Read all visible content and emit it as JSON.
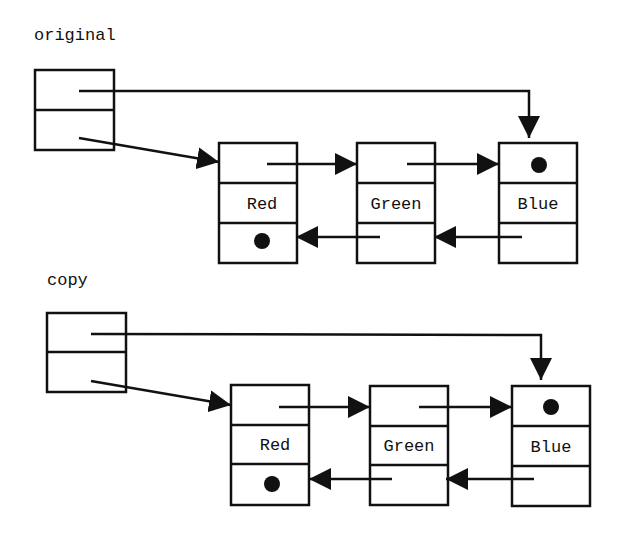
{
  "diagram": {
    "type": "doubly-linked-list-copy",
    "lists": [
      {
        "label": "original",
        "header": {
          "fields": [
            "last",
            "first"
          ]
        },
        "nodes": [
          {
            "value": "Red",
            "prev": "null",
            "next": "Green"
          },
          {
            "value": "Green",
            "prev": "Red",
            "next": "Blue"
          },
          {
            "value": "Blue",
            "prev": "Green",
            "next": "null"
          }
        ]
      },
      {
        "label": "copy",
        "header": {
          "fields": [
            "last",
            "first"
          ]
        },
        "nodes": [
          {
            "value": "Red",
            "prev": "null",
            "next": "Green"
          },
          {
            "value": "Green",
            "prev": "Red",
            "next": "Blue"
          },
          {
            "value": "Blue",
            "prev": "Green",
            "next": "null"
          }
        ]
      }
    ],
    "null_symbol": "filled-dot"
  }
}
